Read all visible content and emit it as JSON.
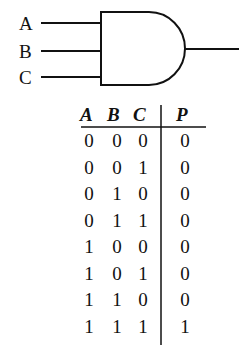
{
  "gate": {
    "type": "AND",
    "inputs": [
      "A",
      "B",
      "C"
    ],
    "output": "P"
  },
  "truth_table": {
    "headers": [
      "A",
      "B",
      "C",
      "P"
    ],
    "rows": [
      [
        "0",
        "0",
        "0",
        "0"
      ],
      [
        "0",
        "0",
        "1",
        "0"
      ],
      [
        "0",
        "1",
        "0",
        "0"
      ],
      [
        "0",
        "1",
        "1",
        "0"
      ],
      [
        "1",
        "0",
        "0",
        "0"
      ],
      [
        "1",
        "0",
        "1",
        "0"
      ],
      [
        "1",
        "1",
        "0",
        "0"
      ],
      [
        "1",
        "1",
        "1",
        "1"
      ]
    ]
  }
}
